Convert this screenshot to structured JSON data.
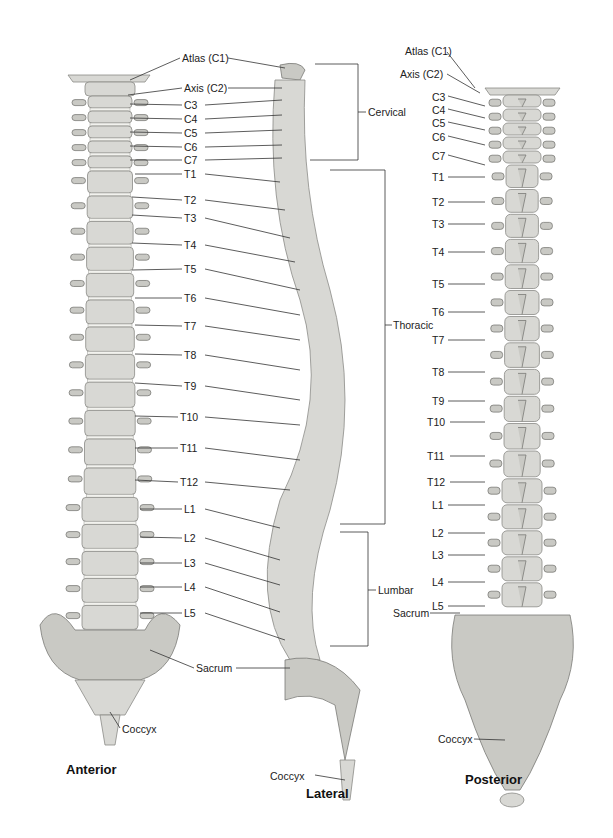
{
  "views": {
    "anterior": {
      "title": "Anterior",
      "labels": [
        "Atlas (C1)",
        "Axis (C2)",
        "C3",
        "C4",
        "C5",
        "C6",
        "C7",
        "T1",
        "T2",
        "T3",
        "T4",
        "T5",
        "T6",
        "T7",
        "T8",
        "T9",
        "T10",
        "T11",
        "T12",
        "L1",
        "L2",
        "L3",
        "L4",
        "L5",
        "Sacrum",
        "Coccyx"
      ]
    },
    "lateral": {
      "title": "Lateral",
      "regions": [
        "Cervical",
        "Thoracic",
        "Lumbar"
      ],
      "labels": [
        "Sacrum",
        "Coccyx"
      ]
    },
    "posterior": {
      "title": "Posterior",
      "labels": [
        "Atlas (C1)",
        "Axis (C2)",
        "C3",
        "C4",
        "C5",
        "C6",
        "C7",
        "T1",
        "T2",
        "T3",
        "T4",
        "T5",
        "T6",
        "T7",
        "T8",
        "T9",
        "T10",
        "T11",
        "T12",
        "L1",
        "L2",
        "L3",
        "L4",
        "L5",
        "Sacrum",
        "Coccyx"
      ]
    }
  },
  "colors": {
    "bone": "#d8d8d4",
    "line": "#333333",
    "text": "#222222",
    "background": "#ffffff"
  }
}
